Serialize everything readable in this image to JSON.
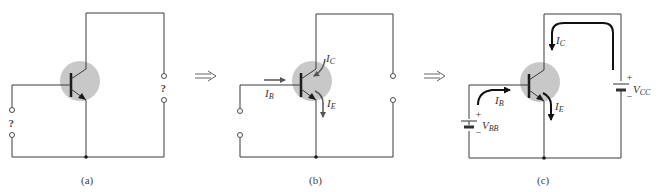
{
  "figure": {
    "panels": [
      {
        "id": "a",
        "caption": "(a)",
        "input_terminal_label": "?",
        "output_terminal_label": "?"
      },
      {
        "id": "b",
        "caption": "(b)",
        "currents": {
          "base": {
            "main": "I",
            "sub": "B"
          },
          "collector": {
            "main": "I",
            "sub": "C"
          },
          "emitter": {
            "main": "I",
            "sub": "E"
          }
        }
      },
      {
        "id": "c",
        "caption": "(c)",
        "currents": {
          "base": {
            "main": "I",
            "sub": "B"
          },
          "collector": {
            "main": "I",
            "sub": "C"
          },
          "emitter": {
            "main": "I",
            "sub": "E"
          }
        },
        "sources": {
          "base_supply": {
            "main": "V",
            "sub": "BB",
            "plus": "+",
            "minus": "−"
          },
          "collector_supply": {
            "main": "V",
            "sub": "CC",
            "plus": "+",
            "minus": "−"
          }
        }
      }
    ],
    "transition_arrow": "⟹",
    "colors": {
      "transistor_body": "#c8c8c8",
      "wire": "#3a3a3a",
      "current_arrow_b": "#555555",
      "current_arrow_c": "#111111"
    }
  }
}
